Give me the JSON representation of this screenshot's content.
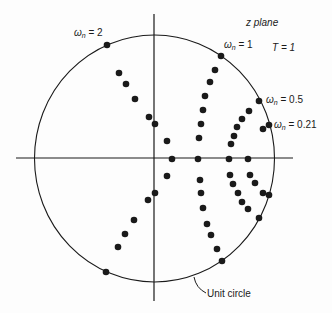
{
  "diagram": {
    "title": "z plane",
    "sampling": "T = 1",
    "circle_label": "Unit circle",
    "omega_labels": [
      {
        "symbol": "ω",
        "sub": "n",
        "value": "= 2"
      },
      {
        "symbol": "ω",
        "sub": "n",
        "value": "= 1"
      },
      {
        "symbol": "ω",
        "sub": "n",
        "value": "= 0.5"
      },
      {
        "symbol": "ω",
        "sub": "n",
        "value": "= 0.21"
      }
    ],
    "colors": {
      "ink": "#1a1a1a",
      "background": "#fdfdfd"
    },
    "points": [
      [
        107,
        45
      ],
      [
        119,
        73
      ],
      [
        126,
        84
      ],
      [
        135,
        99
      ],
      [
        149,
        117
      ],
      [
        155,
        124
      ],
      [
        155,
        193
      ],
      [
        148,
        200
      ],
      [
        134,
        220
      ],
      [
        125,
        234
      ],
      [
        118,
        247
      ],
      [
        106,
        272
      ],
      [
        221,
        56
      ],
      [
        215,
        70
      ],
      [
        210,
        82
      ],
      [
        205,
        96
      ],
      [
        203,
        110
      ],
      [
        201,
        124
      ],
      [
        199,
        138
      ],
      [
        259,
        101
      ],
      [
        249,
        111
      ],
      [
        242,
        119
      ],
      [
        237,
        127
      ],
      [
        234,
        136
      ],
      [
        231,
        144
      ],
      [
        269,
        125
      ],
      [
        263,
        129
      ],
      [
        167,
        141
      ],
      [
        172,
        159
      ],
      [
        198,
        159
      ],
      [
        229,
        159
      ],
      [
        248,
        159
      ],
      [
        167,
        176
      ],
      [
        200,
        180
      ],
      [
        201,
        193
      ],
      [
        203,
        208
      ],
      [
        207,
        224
      ],
      [
        211,
        235
      ],
      [
        217,
        249
      ],
      [
        222,
        261
      ],
      [
        230,
        175
      ],
      [
        233,
        184
      ],
      [
        238,
        193
      ],
      [
        242,
        202
      ],
      [
        248,
        209
      ],
      [
        250,
        175
      ],
      [
        255,
        183
      ],
      [
        263,
        193
      ],
      [
        269,
        195
      ],
      [
        259,
        218
      ]
    ]
  }
}
